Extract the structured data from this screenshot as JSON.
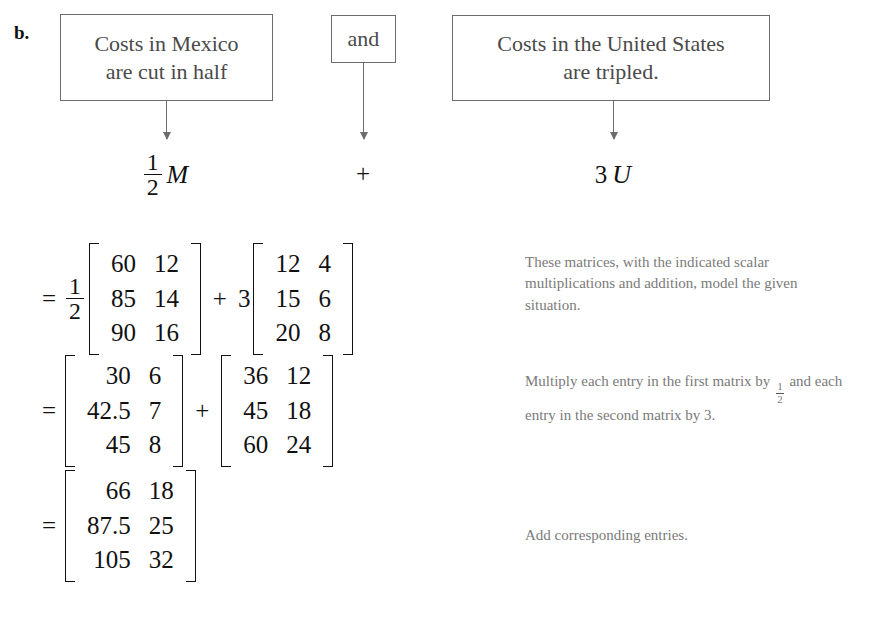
{
  "part_label": "b.",
  "boxes": {
    "mexico": {
      "line1": "Costs in Mexico",
      "line2": "are cut in half"
    },
    "conjunction": {
      "label": "and"
    },
    "united_states": {
      "line1": "Costs in the United States",
      "line2": "are tripled."
    }
  },
  "expressions": {
    "left": {
      "numerator": "1",
      "denominator": "2",
      "variable": "M"
    },
    "operator": "+",
    "right": {
      "scalar": "3",
      "variable": "U"
    }
  },
  "equations": [
    {
      "equals": "=",
      "scalar_left": {
        "numerator": "1",
        "denominator": "2"
      },
      "matrix_left": [
        [
          "60",
          "12"
        ],
        [
          "85",
          "14"
        ],
        [
          "90",
          "16"
        ]
      ],
      "operator": "+",
      "scalar_right": "3",
      "matrix_right": [
        [
          "12",
          "4"
        ],
        [
          "15",
          "6"
        ],
        [
          "20",
          "8"
        ]
      ]
    },
    {
      "equals": "=",
      "matrix_left": [
        [
          "30",
          "6"
        ],
        [
          "42.5",
          "7"
        ],
        [
          "45",
          "8"
        ]
      ],
      "operator": "+",
      "matrix_right": [
        [
          "36",
          "12"
        ],
        [
          "45",
          "18"
        ],
        [
          "60",
          "24"
        ]
      ]
    },
    {
      "equals": "=",
      "matrix_result": [
        [
          "66",
          "18"
        ],
        [
          "87.5",
          "25"
        ],
        [
          "105",
          "32"
        ]
      ]
    }
  ],
  "notes": {
    "note1": "These matrices, with the indicated scalar multiplications and addition, model the given situation.",
    "note2_before": "Multiply each entry in the first matrix by",
    "note2_fraction": {
      "numerator": "1",
      "denominator": "2"
    },
    "note2_after": "and each entry in the second matrix by 3.",
    "note3": "Add corresponding entries."
  },
  "colors": {
    "background": "#ffffff",
    "box_border": "#6c6c6c",
    "box_text": "#4a4a4a",
    "math_text": "#111111",
    "note_text": "#7a7a7a"
  }
}
